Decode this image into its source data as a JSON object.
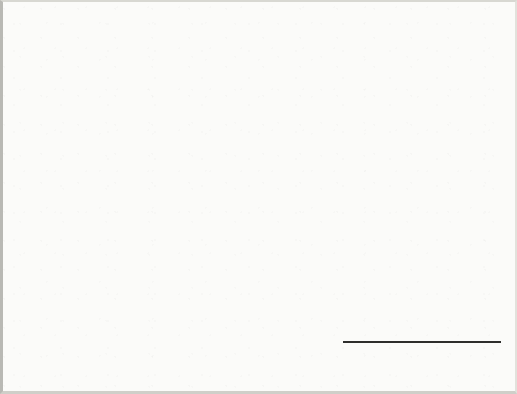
{
  "figure": {
    "caption_lines": [
      "FIGURE 3",
      "Per cent of",
      "4,674 Catholic households",
      "in OLM territory",
      "responding to",
      "OLM Parish census"
    ],
    "caption_label": "Figure",
    "caption_number": "3"
  },
  "axis": {
    "y_title": "Per\ncent",
    "y_title_line1": "Per",
    "y_title_line2": "cent",
    "ticks": [
      "0",
      "10",
      "20",
      "30",
      "40",
      "50",
      "60",
      "70",
      "80",
      "90",
      "100"
    ]
  },
  "legend": {
    "entries": [
      {
        "label": "Could not be contacted",
        "color": "#231f20"
      },
      {
        "label": "Refused to accept forms",
        "color": "#59595b"
      },
      {
        "label": "Accepted,\nbut did not return forms",
        "color": "#d8d9d4"
      },
      {
        "label": "Returned completed forms",
        "color": "#9a9a98"
      }
    ]
  },
  "chart_data": {
    "type": "bar",
    "xlabel": "",
    "ylabel": "Per cent",
    "ylim": [
      0,
      100
    ],
    "ytick_step": 10,
    "grid": true,
    "legend_position": "right",
    "categories": [
      "OLM families",
      "Others",
      "All returns"
    ],
    "category_labels": [
      "OLM families",
      "Others",
      "All\nreturns"
    ],
    "stacked_groups": [
      false,
      false,
      true
    ],
    "series": [
      {
        "name": "Returned completed forms",
        "color": "#9a9a98",
        "values": [
          73.5,
          61.5,
          71.0
        ]
      },
      {
        "name": "Accepted, but did not return forms",
        "color": "#d8d9d4",
        "values": [
          11.0,
          17.0,
          12.0
        ]
      },
      {
        "name": "Refused to accept forms",
        "color": "#59595b",
        "values": [
          12.0,
          20.7,
          14.0
        ]
      },
      {
        "name": "Could not be contacted",
        "color": "#231f20",
        "values": [
          3.0,
          0.0,
          3.0
        ]
      }
    ],
    "stack_boundaries_all_returns": [
      0,
      71,
      83,
      97,
      100
    ]
  },
  "colors": {
    "page_background": "#fbfbf9",
    "grid": "#8a8a85",
    "axis": "#2e2e2c",
    "text": "#2e2e2c",
    "caption_text": "#1d1d1b"
  }
}
